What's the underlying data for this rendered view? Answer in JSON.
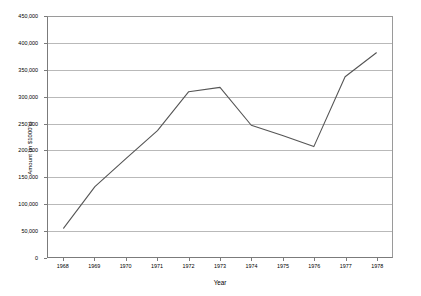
{
  "chart_data": {
    "type": "line",
    "title": "",
    "xlabel": "Year",
    "ylabel": "Amount (in $1000's)",
    "categories": [
      "1968",
      "1969",
      "1970",
      "1971",
      "1972",
      "1973",
      "1974",
      "1975",
      "1976",
      "1977",
      "1978"
    ],
    "values": [
      54000,
      132000,
      185000,
      237000,
      310000,
      318000,
      247000,
      228000,
      207000,
      338000,
      383000
    ],
    "series": [
      {
        "name": "Amount",
        "values": [
          54000,
          132000,
          185000,
          237000,
          310000,
          318000,
          247000,
          228000,
          207000,
          338000,
          383000
        ]
      }
    ],
    "ylim": [
      0,
      450000
    ],
    "y_ticks": [
      0,
      50000,
      100000,
      150000,
      200000,
      250000,
      300000,
      350000,
      400000,
      450000
    ],
    "y_tick_labels": [
      "0",
      "50,000",
      "100,000",
      "150,000",
      "200,000",
      "250,000",
      "300,000",
      "350,000",
      "400,000",
      "450,000"
    ],
    "x_tick_labels": [
      "1968",
      "1969",
      "1970",
      "1971",
      "1972",
      "1973",
      "1974",
      "1975",
      "1976",
      "1977",
      "1978"
    ],
    "grid": "horizontal",
    "legend": "none",
    "line_color": "#555555",
    "gridline_color": "#b9b9b9",
    "axis_color": "#7b7b7b",
    "plot_background": "#ffffff",
    "markers": "none"
  }
}
